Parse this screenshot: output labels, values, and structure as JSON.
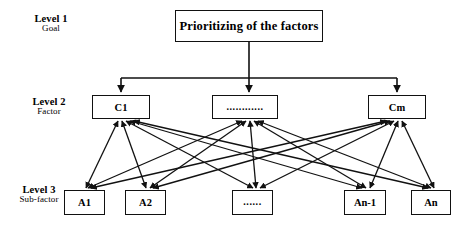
{
  "diagram": {
    "title_text": "Prioritizing of the factors",
    "levels": [
      {
        "title": "Level 1",
        "subtitle": "Goal"
      },
      {
        "title": "Level 2",
        "subtitle": "Factor"
      },
      {
        "title": "Level 3",
        "subtitle": "Sub-factor"
      }
    ],
    "goal": {
      "label": "Prioritizing of the factors"
    },
    "factors": [
      {
        "label": "C1"
      },
      {
        "label": "............"
      },
      {
        "label": "Cm"
      }
    ],
    "subfactors": [
      {
        "label": "A1"
      },
      {
        "label": "A2"
      },
      {
        "label": "......"
      },
      {
        "label": "An-1"
      },
      {
        "label": "An"
      }
    ],
    "colors": {
      "stroke": "#111111",
      "background": "#ffffff",
      "text": "#000000"
    }
  }
}
